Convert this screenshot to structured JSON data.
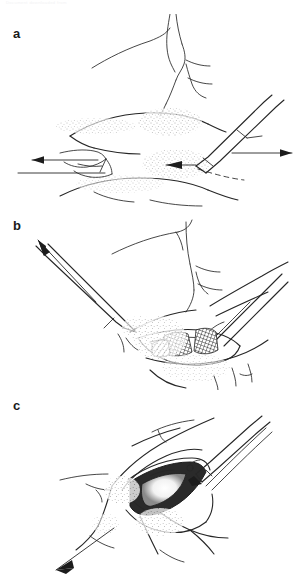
{
  "figure": {
    "kind": "surgical-technique-line-drawing",
    "background_color": "#ffffff",
    "ink_color": "#262626",
    "watermark_text": "Document downloaded from",
    "panels": [
      {
        "id": "a",
        "label": "a",
        "caption": "",
        "annotations": [
          {
            "name": "traction-arrow-left",
            "direction": "left"
          },
          {
            "name": "traction-arrow-right",
            "direction": "right"
          },
          {
            "name": "incision-arrow",
            "direction": "left"
          },
          {
            "name": "scalpel",
            "direction": "upper-right"
          },
          {
            "name": "dashed-incision-line",
            "direction": "lower-right"
          }
        ]
      },
      {
        "id": "b",
        "label": "b",
        "caption": "",
        "annotations": [
          {
            "name": "retraction-arrow",
            "direction": "upper-left"
          },
          {
            "name": "retractor-instrument",
            "direction": "upper-left"
          },
          {
            "name": "forceps-instrument",
            "direction": "upper-right"
          },
          {
            "name": "hatched-tissue-plane",
            "direction": "center"
          }
        ]
      },
      {
        "id": "c",
        "label": "c",
        "caption": "",
        "annotations": [
          {
            "name": "traction-arrow",
            "direction": "lower-left"
          },
          {
            "name": "needle-holder-instrument",
            "direction": "upper-right"
          },
          {
            "name": "open-wound-cavity",
            "direction": "center"
          }
        ]
      }
    ]
  }
}
